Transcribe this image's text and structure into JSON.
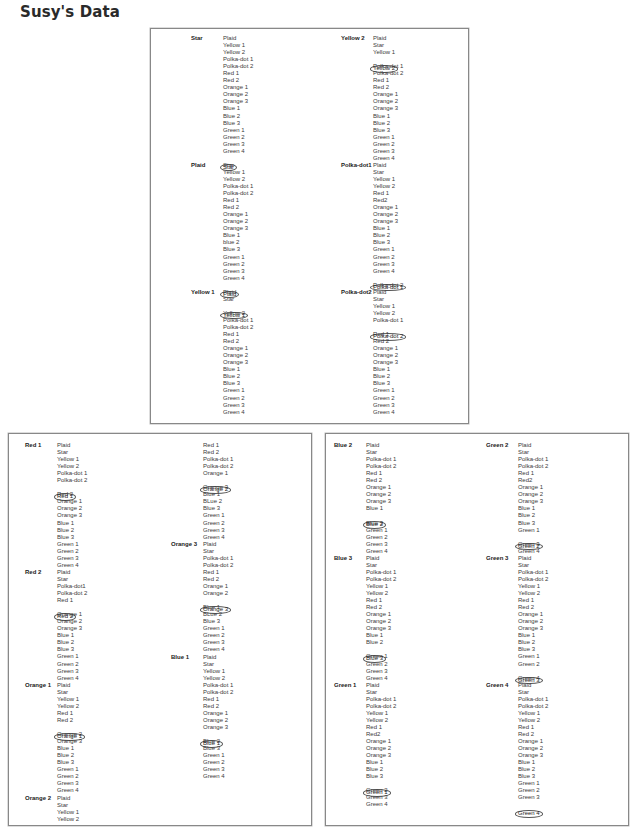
{
  "title": "Susy's Data",
  "panels": [
    {
      "id": "top",
      "columns": [
        {
          "groups": [
            {
              "label": "Star",
              "items": [
                "Plaid",
                "Yellow 1",
                "Yellow 2",
                "Polka-dot 1",
                "Polka-dot 2",
                "Red 1",
                "Red 2",
                "Orange 1",
                "Orange 2",
                "Orange 3",
                "Blue 1",
                "Blue 2",
                "Blue 3",
                "Green 1",
                "Green 2",
                "Green 3",
                "Green 4",
                "Star"
              ],
              "circled": 17
            },
            {
              "label": "Plaid",
              "items": [
                "Star",
                "Yellow 1",
                "Yellow 2",
                "Polka-dot 1",
                "Polka-dot 2",
                "Red 1",
                "Red 2",
                "Orange 1",
                "Orange 2",
                "Orange 3",
                "Blue 1",
                "blue 2",
                "Blue 3",
                "Green 1",
                "Green 2",
                "Green 3",
                "Green 4",
                "Plaid"
              ],
              "circled": 17
            },
            {
              "label": "Yellow 1",
              "items": [
                "Plaid",
                "Star",
                "Yellow 1",
                "Yellow 2",
                "Polka-dot 1",
                "Polka-dot 2",
                "Red 1",
                "Red 2",
                "Orange 1",
                "Orange 2",
                "Orange 3",
                "Blue 1",
                "Blue 2",
                "Blue 3",
                "Green 1",
                "Green 2",
                "Green 3",
                "Green 4"
              ],
              "circled": 2
            }
          ]
        },
        {
          "groups": [
            {
              "label": "Yellow 2",
              "items": [
                "Plaid",
                "Star",
                "Yellow 1",
                "Yellow 2",
                "Polka-dot 1",
                "Polka-dot 2",
                "Red 1",
                "Red 2",
                "Orange 1",
                "Orange 2",
                "Orange 3",
                "Blue 1",
                "Blue 2",
                "Blue 3",
                "Green 1",
                "Green 2",
                "Green 3",
                "Green 4"
              ],
              "circled": 3
            },
            {
              "label": "Polka-dot1",
              "items": [
                "Plaid",
                "Star",
                "Yellow 1",
                "Yellow 2",
                "Red 1",
                "Red2",
                "Orange 1",
                "Orange 2",
                "Orange 3",
                "Blue 1",
                "Blue 2",
                "Blue 3",
                "Green 1",
                "Green 2",
                "Green 3",
                "Green 4",
                "Polka-dot 1",
                "Polka-dot 2"
              ],
              "circled": 16
            },
            {
              "label": "Polka-dot2",
              "items": [
                "Plaid",
                "Star",
                "Yellow 1",
                "Yellow 2",
                "Polka-dot 1",
                "Polka-dot 2",
                "Red 1",
                "Red 2",
                "Orange 1",
                "Orange 2",
                "Orange 3",
                "Blue 1",
                "Blue 2",
                "Blue 3",
                "Green 1",
                "Green 2",
                "Green 3",
                "Green 4"
              ],
              "circled": 5
            }
          ]
        }
      ]
    },
    {
      "id": "bottom-left",
      "columns": [
        {
          "groups": [
            {
              "label": "Red 1",
              "items": [
                "Plaid",
                "Star",
                "Yellow 1",
                "Yellow 2",
                "Polka-dot 1",
                "Polka-dot 2",
                "Red 1",
                "Red 2",
                "Orange 1",
                "Orange 2",
                "Orange 3",
                "Blue 1",
                "Blue 2",
                "Blue 3",
                "Green 1",
                "Green 2",
                "Green 3",
                "Green 4"
              ],
              "circled": 6
            },
            {
              "label": "Red 2",
              "items": [
                "Plaid",
                "Star",
                "Polka-dot1",
                "Polka-dot 2",
                "Red 1",
                "Red 2",
                "Orange 1",
                "Orange 2",
                "Orange 3",
                "Blue 1",
                "Blue 2",
                "Blue 3",
                "Green 1",
                "Green 2",
                "Green 3",
                "Green 4"
              ],
              "circled": 5
            },
            {
              "label": "Orange 1",
              "items": [
                "Plaid",
                "Star",
                "Yellow 1",
                "Yellow 2",
                "Red 1",
                "Red 2",
                "Orange 1",
                "Orange 2",
                "Orange 3",
                "Blue 1",
                "Blue 2",
                "Blue 3",
                "Green 1",
                "Green 2",
                "Green 3",
                "Green 4"
              ],
              "circled": 6
            },
            {
              "label": "Orange 2",
              "items": [
                "Plaid",
                "Star",
                "Yellow 1",
                "Yellow 2"
              ],
              "circled": -1
            }
          ]
        },
        {
          "groups": [
            {
              "label": "",
              "items": [
                "Red 1",
                "Red 2",
                "Polka-dot 1",
                "Polka-dot 2",
                "Orange 1",
                "Orange 2",
                "Orange 3",
                "Blue 1",
                "BLue 2",
                "Blue 3",
                "Green 1",
                "Green 2",
                "Green 3",
                "Green 4"
              ],
              "circled": 5
            },
            {
              "label": "Orange 3",
              "items": [
                "Plaid",
                "Star",
                "Polka-dot 1",
                "Polka-dot 2",
                "Red 1",
                "Red 2",
                "Orange 1",
                "Orange 2",
                "Orange 3",
                "Blue 1",
                "BLue 2",
                "Blue 3",
                "Green 1",
                "Green 2",
                "Green 3",
                "Green 4"
              ],
              "circled": 8
            },
            {
              "label": "Blue 1",
              "items": [
                "Plaid",
                "Star",
                "Yellow 1",
                "Yellow 2",
                "Polka-dot 1",
                "Polka-dot 2",
                "Red 1",
                "Red 2",
                "Orange 1",
                "Orange 2",
                "Orange 3",
                "Blue 1",
                "Blue 2",
                "Blue 3",
                "Green 1",
                "Green 2",
                "Green 3",
                "Green 4"
              ],
              "circled": 11
            }
          ]
        }
      ]
    },
    {
      "id": "bottom-right",
      "columns": [
        {
          "groups": [
            {
              "label": "Blue 2",
              "items": [
                "Plaid",
                "Star",
                "Polka-dot 1",
                "Polka-dot 2",
                "Red 1",
                "Red 2",
                "Orange 1",
                "Orange 2",
                "Orange 3",
                "Blue 1",
                "Blue 2",
                "Blue 3",
                "Green 1",
                "Green 2",
                "Green 3",
                "Green 4"
              ],
              "circled": 10
            },
            {
              "label": "Blue 3",
              "items": [
                "Plaid",
                "Star",
                "Polka-dot 1",
                "Polka-dot 2",
                "Yellow 1",
                "Yellow 2",
                "Red 1",
                "Red 2",
                "Orange 1",
                "Orange 2",
                "Orange 3",
                "Blue 1",
                "Blue 2",
                "Blue 3",
                "Green 1",
                "Green 2",
                "Green 3",
                "Green 4"
              ],
              "circled": 13
            },
            {
              "label": "Green 1",
              "items": [
                "Plaid",
                "Star",
                "Polka-dot 1",
                "Polka-dot 2",
                "Yellow 1",
                "Yellow 2",
                "Red 1",
                "Red2",
                "Orange 1",
                "Orange 2",
                "Orange 3",
                "Blue 1",
                "Blue 2",
                "Blue 3",
                "Green 1",
                "Green 2",
                "Green 3",
                "Green 4"
              ],
              "circled": 14
            }
          ]
        },
        {
          "groups": [
            {
              "label": "Green 2",
              "items": [
                "Plaid",
                "Star",
                "Polka-dot 1",
                "Polka-dot 2",
                "Red 1",
                "Red2",
                "Orange 1",
                "Orange 2",
                "Orange 3",
                "Blue 1",
                "Blue 2",
                "Blue 3",
                "Green 1",
                "Green 2",
                "Green 3",
                "Green 4"
              ],
              "circled": 13
            },
            {
              "label": "Green 3",
              "items": [
                "Plaid",
                "Star",
                "Polka-dot 1",
                "Polka-dot 2",
                "Yellow 1",
                "Yellow 2",
                "Red 1",
                "Red 2",
                "Orange 1",
                "Orange 2",
                "Orange 3",
                "Blue 1",
                "Blue 2",
                "Blue 3",
                "Green 1",
                "Green 2",
                "Green 3",
                "Green 4"
              ],
              "circled": 16
            },
            {
              "label": "Green 4",
              "items": [
                "Plaid",
                "Star",
                "Polka-dot 1",
                "Polka-dot 2",
                "Yellow 1",
                "Yellow 2",
                "Red 1",
                "Red 2",
                "Orange 1",
                "Orange 2",
                "Orange 3",
                "Blue 1",
                "Blue 2",
                "Blue 3",
                "Green 1",
                "Green 2",
                "Green 3",
                "Green 4"
              ],
              "circled": 17
            }
          ]
        }
      ]
    }
  ]
}
